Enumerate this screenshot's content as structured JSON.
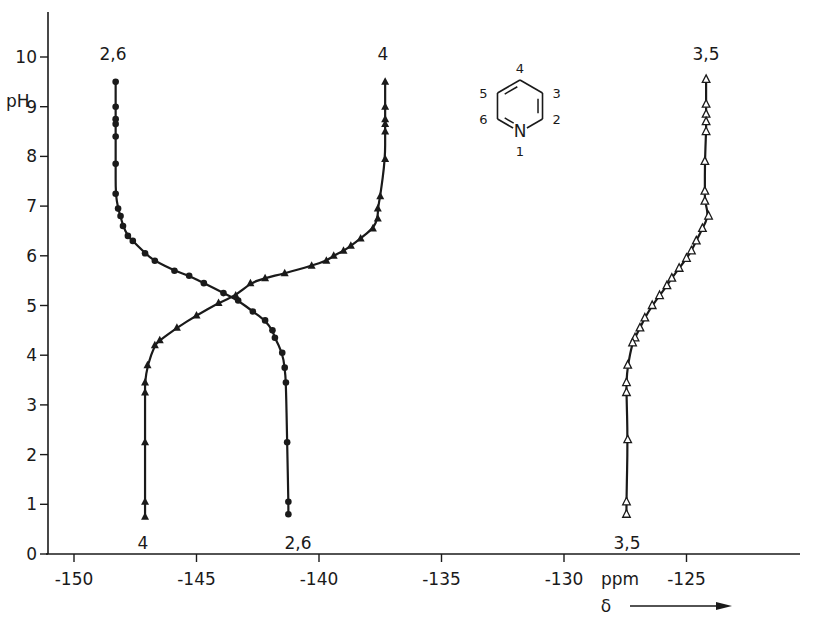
{
  "chart_data": {
    "type": "line",
    "title": "",
    "xlabel": "ppm",
    "xlabel_secondary": "δ",
    "ylabel": "pH",
    "xlim": [
      -151.5,
      -120.5
    ],
    "ylim": [
      0,
      10.8
    ],
    "x_ticks": [
      -150,
      -145,
      -140,
      -135,
      -130,
      -125
    ],
    "x_tick_labels": [
      "-150",
      "-145",
      "-140",
      "-135",
      "-130",
      "-125"
    ],
    "y_ticks": [
      0,
      1,
      2,
      3,
      4,
      5,
      6,
      7,
      8,
      9,
      10
    ],
    "y_tick_labels": [
      "0",
      "1",
      "2",
      "3",
      "4",
      "5",
      "6",
      "7",
      "8",
      "9",
      "10"
    ],
    "grid": false,
    "legend": "none (curves labeled directly)",
    "series": [
      {
        "name": "2,6",
        "marker": "filled-circle",
        "top_label": "2,6",
        "bottom_label": "2,6",
        "points": [
          [
            -148.3,
            9.5
          ],
          [
            -148.3,
            9.0
          ],
          [
            -148.3,
            8.75
          ],
          [
            -148.3,
            8.65
          ],
          [
            -148.3,
            8.4
          ],
          [
            -148.3,
            7.85
          ],
          [
            -148.3,
            7.25
          ],
          [
            -148.2,
            6.95
          ],
          [
            -148.1,
            6.8
          ],
          [
            -148.0,
            6.6
          ],
          [
            -147.8,
            6.4
          ],
          [
            -147.6,
            6.3
          ],
          [
            -147.1,
            6.05
          ],
          [
            -146.7,
            5.9
          ],
          [
            -145.9,
            5.7
          ],
          [
            -145.3,
            5.6
          ],
          [
            -144.7,
            5.45
          ],
          [
            -143.9,
            5.25
          ],
          [
            -143.3,
            5.1
          ],
          [
            -142.7,
            4.88
          ],
          [
            -142.2,
            4.7
          ],
          [
            -141.9,
            4.5
          ],
          [
            -141.8,
            4.35
          ],
          [
            -141.5,
            4.05
          ],
          [
            -141.4,
            3.75
          ],
          [
            -141.35,
            3.45
          ],
          [
            -141.3,
            2.25
          ],
          [
            -141.25,
            1.05
          ],
          [
            -141.25,
            0.8
          ]
        ]
      },
      {
        "name": "4",
        "marker": "filled-triangle",
        "top_label": "4",
        "bottom_label": "4",
        "points": [
          [
            -137.3,
            9.5
          ],
          [
            -137.3,
            9.0
          ],
          [
            -137.3,
            8.75
          ],
          [
            -137.3,
            8.65
          ],
          [
            -137.3,
            8.5
          ],
          [
            -137.3,
            7.95
          ],
          [
            -137.5,
            7.2
          ],
          [
            -137.6,
            6.95
          ],
          [
            -137.6,
            6.75
          ],
          [
            -137.8,
            6.55
          ],
          [
            -138.3,
            6.35
          ],
          [
            -138.7,
            6.2
          ],
          [
            -139.0,
            6.1
          ],
          [
            -139.4,
            6.0
          ],
          [
            -139.7,
            5.9
          ],
          [
            -140.3,
            5.8
          ],
          [
            -141.4,
            5.65
          ],
          [
            -142.2,
            5.55
          ],
          [
            -142.8,
            5.45
          ],
          [
            -143.4,
            5.2
          ],
          [
            -144.1,
            5.05
          ],
          [
            -145.0,
            4.8
          ],
          [
            -145.8,
            4.55
          ],
          [
            -146.5,
            4.3
          ],
          [
            -146.7,
            4.2
          ],
          [
            -147.0,
            3.8
          ],
          [
            -147.1,
            3.45
          ],
          [
            -147.1,
            3.25
          ],
          [
            -147.1,
            2.25
          ],
          [
            -147.1,
            1.05
          ],
          [
            -147.1,
            0.75
          ]
        ]
      },
      {
        "name": "3,5",
        "marker": "open-triangle",
        "top_label": "3,5",
        "bottom_label": "3,5",
        "points": [
          [
            -124.2,
            9.55
          ],
          [
            -124.2,
            9.05
          ],
          [
            -124.2,
            8.85
          ],
          [
            -124.2,
            8.7
          ],
          [
            -124.2,
            8.5
          ],
          [
            -124.25,
            7.9
          ],
          [
            -124.25,
            7.3
          ],
          [
            -124.25,
            7.1
          ],
          [
            -124.1,
            6.8
          ],
          [
            -124.35,
            6.55
          ],
          [
            -124.6,
            6.3
          ],
          [
            -124.8,
            6.1
          ],
          [
            -125.0,
            5.95
          ],
          [
            -125.3,
            5.75
          ],
          [
            -125.6,
            5.55
          ],
          [
            -125.8,
            5.4
          ],
          [
            -126.1,
            5.2
          ],
          [
            -126.4,
            5.0
          ],
          [
            -126.7,
            4.75
          ],
          [
            -126.9,
            4.55
          ],
          [
            -127.1,
            4.35
          ],
          [
            -127.2,
            4.25
          ],
          [
            -127.4,
            3.8
          ],
          [
            -127.45,
            3.45
          ],
          [
            -127.45,
            3.25
          ],
          [
            -127.4,
            2.3
          ],
          [
            -127.45,
            1.05
          ],
          [
            -127.45,
            0.8
          ]
        ]
      }
    ],
    "annotations": [
      {
        "text": "Pyridine ring numbering: N=1, positions 2,3,4,5,6"
      },
      {
        "text": "δ →"
      }
    ]
  },
  "molecule": {
    "name": "pyridine",
    "heteroatom": "N",
    "positions": {
      "p1": "1",
      "p2": "2",
      "p3": "3",
      "p4": "4",
      "p5": "5",
      "p6": "6"
    }
  },
  "axis": {
    "x_unit": "ppm",
    "x_symbol": "δ",
    "y_unit": "pH"
  }
}
